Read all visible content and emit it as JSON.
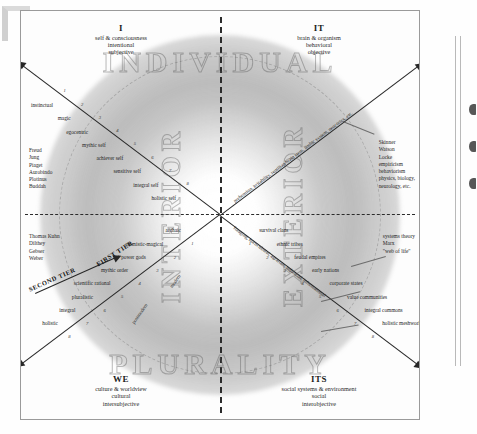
{
  "figure": {
    "watermarks": {
      "top": "INDIVIDUAL",
      "bottom": "PLURALITY",
      "left": "INTERIOR",
      "right": "EXTERIOR"
    },
    "tiers": {
      "first": "FIRST TIER",
      "second": "SECOND TIER"
    }
  },
  "quadrants": {
    "upper_left": {
      "key": "I",
      "line1": "self & consciousness",
      "line2": "intentional",
      "line3": "subjective"
    },
    "upper_right": {
      "key": "IT",
      "line1": "brain & organism",
      "line2": "behavioral",
      "line3": "objective"
    },
    "lower_left": {
      "key": "WE",
      "line1": "culture & worldview",
      "line2": "cultural",
      "line3": "intersubjective"
    },
    "lower_right": {
      "key": "ITS",
      "line1": "social systems & environment",
      "line2": "social",
      "line3": "interobjective"
    }
  },
  "thinkers": {
    "upper_left": [
      "Freud",
      "Jung",
      "Piaget",
      "Aurobindo",
      "Plotinus",
      "Buddah"
    ],
    "lower_left": [
      "Thomas Kuhn",
      "Dilthey",
      "Gebser",
      "Weber"
    ],
    "upper_right": [
      "Skinner",
      "Watson",
      "Locke",
      "empiricism",
      "behaviorism",
      "physics, biology,",
      "neurology, etc."
    ],
    "lower_right": [
      "systems theory",
      "Marx",
      "\"web of life\""
    ]
  },
  "stages": {
    "upper_left": [
      {
        "n": "8",
        "label": "holistic self"
      },
      {
        "n": "7",
        "label": "integral self"
      },
      {
        "n": "6",
        "label": "sensitive self"
      },
      {
        "n": "5",
        "label": "achiever self"
      },
      {
        "n": "4",
        "label": "mythic self"
      },
      {
        "n": "3",
        "label": "egocentric"
      },
      {
        "n": "2",
        "label": "magic"
      },
      {
        "n": "1",
        "label": "instinctual"
      }
    ],
    "lower_left": [
      {
        "n": "1",
        "label": "archaic"
      },
      {
        "n": "2",
        "label": "animistic-magical"
      },
      {
        "n": "3",
        "label": "power gods"
      },
      {
        "n": "4",
        "label": "mythic order"
      },
      {
        "n": "5",
        "label": "scientific rational"
      },
      {
        "n": "6",
        "label": "pluralistic"
      },
      {
        "n": "7",
        "label": "integral"
      },
      {
        "n": "8",
        "label": "holistic"
      }
    ],
    "lower_right": [
      {
        "n": "1",
        "label": "survival clans"
      },
      {
        "n": "2",
        "label": "ethnic tribes"
      },
      {
        "n": "3",
        "label": "feudal empires"
      },
      {
        "n": "4",
        "label": "early nations"
      },
      {
        "n": "5",
        "label": "corporate states"
      },
      {
        "n": "6",
        "label": "value communities"
      },
      {
        "n": "7",
        "label": "integral commons"
      },
      {
        "n": "8",
        "label": "holistic meshworks"
      }
    ]
  },
  "spokes": {
    "upper_right": "prehension, irritability, reptilian brain stem, limbic system, neocortex, etc.",
    "lower_left_modern": "modern",
    "lower_left_postmodern": "postmodern",
    "lower_right": "foraging, horticultural, agrarian, industrial, informational"
  },
  "colors": {
    "ink": "#222222",
    "rule": "#2b2b2b",
    "watermark": "#5a5a5a",
    "paper": "#fdfdfd"
  }
}
